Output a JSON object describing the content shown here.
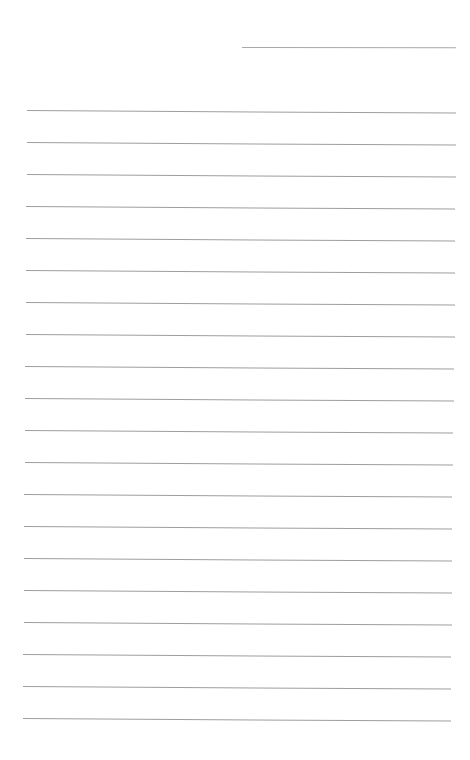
{
  "page": {
    "type": "blank lined paper",
    "background_color": "#ffffff",
    "line_color": "#9e9e9e"
  },
  "header_line": {
    "x_start": 242,
    "x_end": 456,
    "y": 47,
    "text": ""
  },
  "ruled_lines": {
    "count": 20,
    "first_y": 110,
    "spacing": 32,
    "x_start_top": 27,
    "x_end_top": 456,
    "x_start_bottom": 23,
    "x_end_bottom": 451,
    "tilt_deg": 0.35,
    "written_content": ""
  }
}
